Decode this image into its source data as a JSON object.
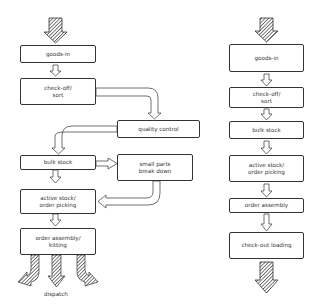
{
  "left_flow": {
    "boxes": [
      {
        "id": "goods-in",
        "label": "goods-in"
      },
      {
        "id": "check-off-sort",
        "label": "check-off/\nsort"
      },
      {
        "id": "quality-control",
        "label": "quality control"
      },
      {
        "id": "bulk-stock",
        "label": "bulk stock"
      },
      {
        "id": "small-parts",
        "label": "small parts\nbreak down"
      },
      {
        "id": "active-stock",
        "label": "active stock/\norder picking"
      },
      {
        "id": "order-assembly",
        "label": "order assembly/\nkitting"
      }
    ],
    "output_label": "dispatch"
  },
  "right_flow": {
    "boxes": [
      {
        "id": "goods-in",
        "label": "goods-in"
      },
      {
        "id": "check-off-sort",
        "label": "check-off/\nsort"
      },
      {
        "id": "bulk-stock",
        "label": "bulk stock"
      },
      {
        "id": "active-stock",
        "label": "active stock/\norder picking"
      },
      {
        "id": "order-assembly",
        "label": "order assembly"
      },
      {
        "id": "check-out-loading",
        "label": "check-out loading"
      }
    ]
  },
  "colors": {
    "stroke": "#333333",
    "hatch": "#555555",
    "background": "#ffffff"
  }
}
